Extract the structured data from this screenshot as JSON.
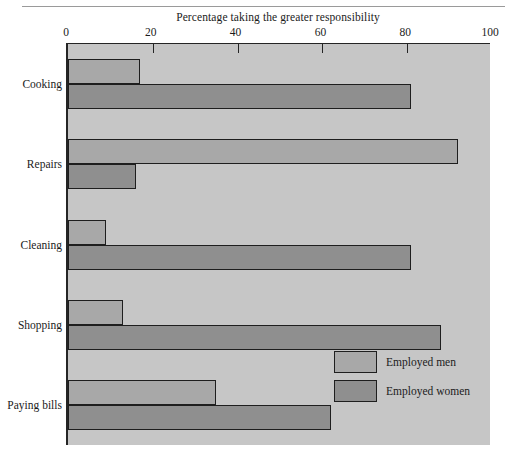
{
  "chart_data": {
    "type": "bar",
    "orientation": "horizontal",
    "title": "Percentage taking the greater responsibility",
    "xlabel": "Percentage taking the greater responsibility",
    "ylabel": "",
    "xlim": [
      0,
      100
    ],
    "xticks": [
      0,
      20,
      40,
      60,
      80,
      100
    ],
    "xticklabels": [
      "0",
      "20",
      "40",
      "60",
      "80",
      "100"
    ],
    "grid": false,
    "legend_position": "bottom-right",
    "categories": [
      "Cooking",
      "Repairs",
      "Cleaning",
      "Shopping",
      "Paying bills"
    ],
    "series": [
      {
        "name": "Employed men",
        "color": "#a8a8a8",
        "values": [
          17,
          92,
          9,
          13,
          35
        ]
      },
      {
        "name": "Employed women",
        "color": "#8f8f8f",
        "values": [
          81,
          16,
          81,
          88,
          62
        ]
      }
    ]
  },
  "legend": {
    "entries": [
      {
        "label": "Employed men",
        "swatch": "men"
      },
      {
        "label": "Employed women",
        "swatch": "women"
      }
    ]
  },
  "colors": {
    "plot_background": "#c6c6c6",
    "page_background": "#ffffff",
    "axis": "#252525",
    "bar_border": "#1e1e1e",
    "men_fill": "#a8a8a8",
    "women_fill": "#8f8f8f",
    "text": "#1b1b1b",
    "rule": "#9a9a9a"
  }
}
